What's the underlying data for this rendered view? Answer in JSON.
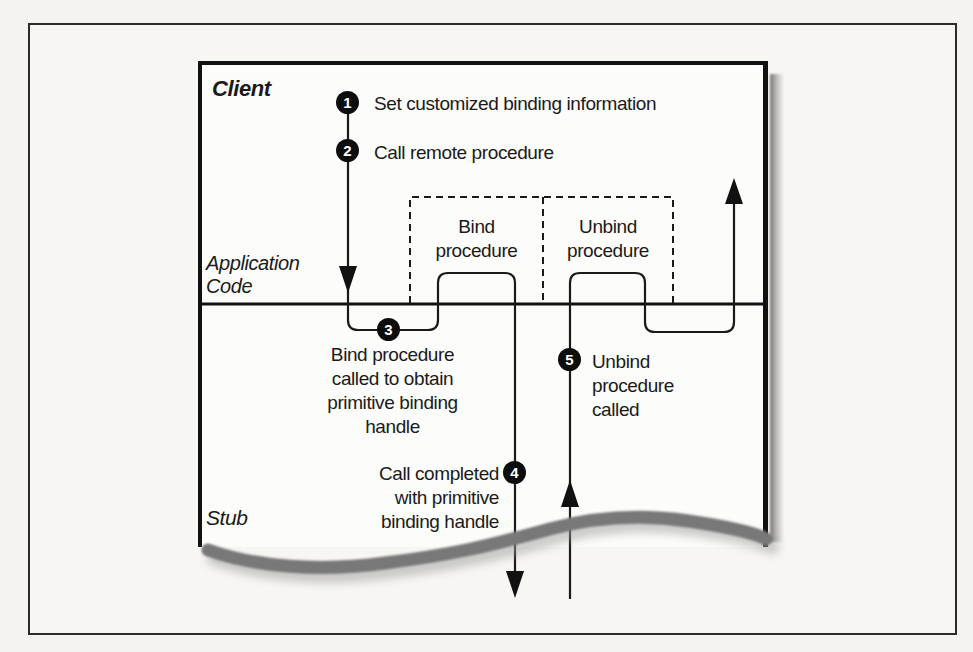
{
  "labels": {
    "client": "Client",
    "application_code": "Application\nCode",
    "stub": "Stub"
  },
  "procedure_boxes": {
    "bind": "Bind\nprocedure",
    "unbind": "Unbind\nprocedure"
  },
  "steps": [
    {
      "number": "1",
      "label": "Set customized binding information"
    },
    {
      "number": "2",
      "label": "Call remote procedure"
    },
    {
      "number": "3",
      "label": "Bind procedure\ncalled to obtain\nprimitive binding\nhandle"
    },
    {
      "number": "4",
      "label": "Call completed\nwith primitive\nbinding handle"
    },
    {
      "number": "5",
      "label": "Unbind\nprocedure\ncalled"
    }
  ],
  "colors": {
    "ink": "#1a1a1a",
    "paper": "#f4f3ef",
    "box_fill": "#fcfcfa",
    "torn_edge_gray": "#787878"
  }
}
